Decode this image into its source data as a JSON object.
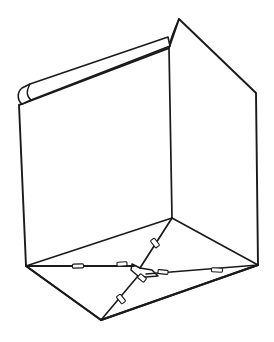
{
  "figure": {
    "view": "three-quarter view from above, looking into the open box",
    "style": "black ink line drawing on white",
    "background_color": "#ffffff",
    "line_color": "#1a1a1a",
    "canvas": {
      "width": 274,
      "height": 342
    }
  },
  "geometry": {
    "vertices": {
      "top_apex": [
        179,
        19
      ],
      "inner_top_corner": [
        169,
        48
      ],
      "left_top_corner": [
        19,
        105
      ],
      "right_top_corner": [
        256,
        93
      ],
      "left_bottom_corner": [
        26,
        266
      ],
      "right_bottom_corner": [
        258,
        265
      ],
      "inner_bottom_corner": [
        172,
        218
      ],
      "front_bottom_vertex": [
        101,
        320
      ],
      "floor_center": [
        140,
        268
      ]
    },
    "outline_path": "M 179 19 L 169 48 L 19 105 L 26 266 L 101 320 L 258 265 L 256 93 Z",
    "left_panel_path": "M 19 105 L 169 48 L 172 218 L 26 266 Z",
    "right_panel_path": "M 169 48 L 256 93 L 258 265 L 172 218 Z",
    "top_flap_triangle_path": "M 169 48 L 179 19 L 256 93 Z",
    "inner_vertical_edge": "M 169 48 L 172 218",
    "apex_curve_path": "M 179 19 C 174 30 170 40 169 48",
    "floor_edges": [
      {
        "name": "floor-left-edge",
        "path": "M 26 266 L 172 218"
      },
      {
        "name": "floor-right-edge",
        "path": "M 172 218 L 258 265"
      },
      {
        "name": "floor-front-left-edge",
        "path": "M 26 266 L 101 320"
      },
      {
        "name": "floor-front-right-edge",
        "path": "M 101 320 L 258 265"
      }
    ],
    "flap_fold_lines": [
      {
        "name": "fold-from-inner-corner",
        "path": "M 172 218 L 140 268"
      },
      {
        "name": "fold-to-left-corner",
        "path": "M 134 266 L 26 266"
      },
      {
        "name": "fold-to-right-corner",
        "path": "M 146 274 L 258 265"
      },
      {
        "name": "fold-to-front-vertex",
        "path": "M 138 276 L 101 320"
      }
    ],
    "center_overlap_path": "M 132 264 L 140 268 L 152 270 L 158 276 L 146 277 L 138 276 L 131 270 Z",
    "notch_tabs": [
      {
        "name": "notch-left-fold",
        "cx": 78,
        "cy": 266,
        "w": 11,
        "h": 4,
        "angle": -2
      },
      {
        "name": "notch-left-inner",
        "cx": 122,
        "cy": 264,
        "w": 10,
        "h": 4,
        "angle": -4
      },
      {
        "name": "notch-upper-diagonal",
        "cx": 155,
        "cy": 243,
        "w": 9,
        "h": 5,
        "angle": 52
      },
      {
        "name": "notch-right-fold",
        "cx": 217,
        "cy": 270,
        "w": 11,
        "h": 4,
        "angle": 3
      },
      {
        "name": "notch-right-inner",
        "cx": 163,
        "cy": 272,
        "w": 10,
        "h": 4,
        "angle": 5
      },
      {
        "name": "notch-front-diagonal",
        "cx": 121,
        "cy": 299,
        "w": 9,
        "h": 5,
        "angle": 51
      },
      {
        "name": "notch-center-lower",
        "cx": 142,
        "cy": 278,
        "w": 8,
        "h": 5,
        "angle": 40
      }
    ],
    "side_flap": {
      "name": "curled-side-flap",
      "outer_path": "M 22 88 C 17 92 17 100 22 104 L 31 100 L 170 46 L 168 37 L 30 84 Z",
      "crease_path": "M 31 100 C 26 96 26 91 30 84"
    }
  },
  "annotations": {
    "title": "",
    "caption": "",
    "labels": []
  }
}
